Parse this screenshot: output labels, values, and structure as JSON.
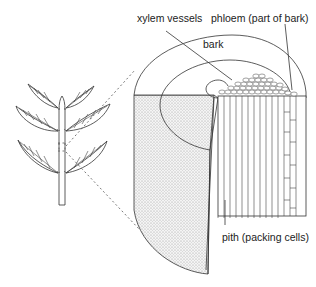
{
  "labels": {
    "xylem": "xylem vessels",
    "phloem": "phloem (part of bark)",
    "bark": "bark",
    "pith": "pith (packing cells)"
  },
  "colors": {
    "line": "#333333",
    "shading": "#d9d9d9",
    "background": "#ffffff"
  }
}
